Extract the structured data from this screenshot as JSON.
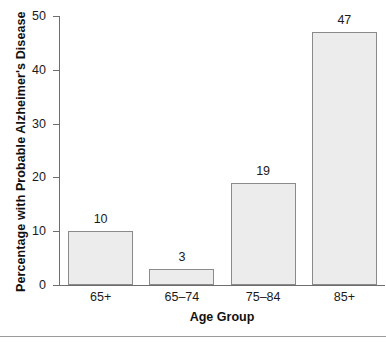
{
  "chart_data": {
    "type": "bar",
    "title": "",
    "categories": [
      "65+",
      "65–74",
      "75–84",
      "85+"
    ],
    "values": [
      10,
      3,
      19,
      47
    ],
    "value_labels": [
      "10",
      "3",
      "19",
      "47"
    ],
    "xlabel": "Age Group",
    "ylabel": "Percentage with Probable Alzheimer's Disease",
    "ylim": [
      0,
      50
    ],
    "yticks": [
      0,
      10,
      20,
      30,
      40,
      50
    ],
    "ytick_labels": [
      "0",
      "10",
      "20",
      "30",
      "40",
      "50"
    ],
    "grid": false,
    "legend": false,
    "bar_fill_color": "#ececec",
    "bar_border_color": "#8a8a8a",
    "axis_color": "#6e6e6e",
    "text_color": "#1a1a1a",
    "background_color": "#ffffff",
    "rule_color": "#9b9b9b"
  }
}
